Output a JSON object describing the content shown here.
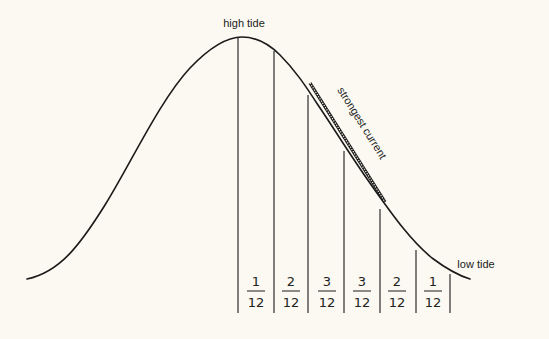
{
  "diagram": {
    "labels": {
      "high_tide": "high tide",
      "low_tide": "low tide",
      "strongest_current": "strongest current"
    },
    "fractions": [
      {
        "numerator": "1",
        "denominator": "12"
      },
      {
        "numerator": "2",
        "denominator": "12"
      },
      {
        "numerator": "3",
        "denominator": "12"
      },
      {
        "numerator": "3",
        "denominator": "12"
      },
      {
        "numerator": "2",
        "denominator": "12"
      },
      {
        "numerator": "1",
        "denominator": "12"
      }
    ],
    "colors": {
      "background": "#fbf9f1",
      "ink": "#1a1a1a"
    }
  }
}
